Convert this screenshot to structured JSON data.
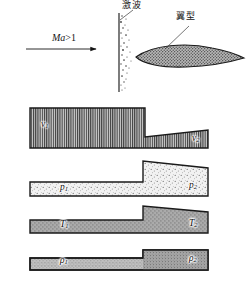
{
  "figure": {
    "title_top_shock": "激波",
    "title_top_airfoil": "翼型",
    "flow_label": "Ma>1",
    "flow_label_italic_part": "Ma",
    "flow_label_rest": ">1"
  },
  "annotations": [
    {
      "name": "shock-wave-label",
      "text": "激波",
      "x": 122,
      "y": 3
    },
    {
      "name": "airfoil-label",
      "text": "翼型",
      "x": 176,
      "y": 14
    },
    {
      "name": "mach-number-label",
      "text": "Ma>1",
      "x": 52,
      "y": 37
    }
  ],
  "panels": [
    {
      "id": "velocity",
      "name": "velocity-profile-panel",
      "quantity": "v",
      "left_label": "v",
      "left_sub": "1",
      "right_label": "v",
      "right_sub": "2",
      "hatch": "vertical-lines",
      "description": "velocity drops across the shock",
      "left_value_high": true
    },
    {
      "id": "pressure",
      "name": "pressure-profile-panel",
      "quantity": "p",
      "left_label": "p",
      "left_sub": "1",
      "right_label": "p",
      "right_sub": "2",
      "hatch": "stipple",
      "description": "pressure rises across the shock",
      "left_value_high": false
    },
    {
      "id": "temperature",
      "name": "temperature-profile-panel",
      "quantity": "T",
      "left_label": "T",
      "left_sub": "1",
      "right_label": "T",
      "right_sub": "2",
      "hatch": "dense-stipple",
      "description": "temperature rises across the shock",
      "left_value_high": false
    },
    {
      "id": "density",
      "name": "density-profile-panel",
      "quantity": "ρ",
      "left_label": "ρ",
      "left_sub": "1",
      "right_label": "ρ",
      "right_sub": "2",
      "hatch": "fine-stipple",
      "description": "density rises across the shock",
      "left_value_high": false
    }
  ],
  "colors": {
    "ink": "#141414",
    "fill_gray": "#9a9a9a",
    "fill_light": "#dcdcdc",
    "background": "#ffffff"
  }
}
